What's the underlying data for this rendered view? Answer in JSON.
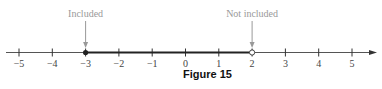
{
  "figure": {
    "caption": "Figure 15",
    "number_line": {
      "ticks": [
        {
          "value": -5,
          "label": "−5"
        },
        {
          "value": -4,
          "label": "−4"
        },
        {
          "value": -3,
          "label": "−3"
        },
        {
          "value": -2,
          "label": "−2"
        },
        {
          "value": -1,
          "label": "−1"
        },
        {
          "value": 0,
          "label": "0"
        },
        {
          "value": 1,
          "label": "1"
        },
        {
          "value": 2,
          "label": "2"
        },
        {
          "value": 3,
          "label": "3"
        },
        {
          "value": 4,
          "label": "4"
        },
        {
          "value": 5,
          "label": "5"
        }
      ],
      "interval": {
        "start": -3,
        "end": 2,
        "start_closed": true,
        "end_closed": false
      },
      "annotations": [
        {
          "label": "Included",
          "at": -3
        },
        {
          "label": "Not included",
          "at": 2
        }
      ]
    },
    "colors": {
      "line": "#333333",
      "interval": "#222222",
      "annotation": "#999999",
      "tick_label": "#444444"
    }
  }
}
